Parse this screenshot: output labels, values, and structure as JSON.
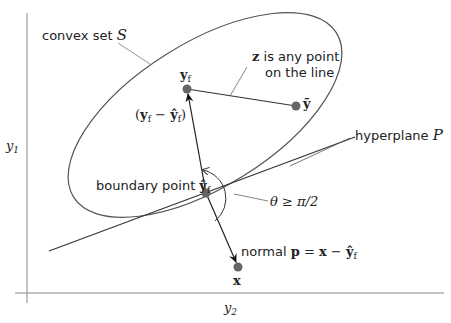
{
  "diagram": {
    "axes": {
      "vertical_label": "y",
      "vertical_label_sub": "1",
      "horizontal_label": "y",
      "horizontal_label_sub": "2"
    },
    "labels": {
      "convex_set_text": "convex set ",
      "convex_set_symbol": "S",
      "z_symbol": "z",
      "z_text_line1": " is any point",
      "z_text_line2": "on the line",
      "yf_symbol": "y",
      "yf_sub": "f",
      "ytilde_symbol": "ỹ",
      "diff_open": "(",
      "diff_y": "y",
      "diff_sub1": "f",
      "diff_minus": " − ",
      "diff_yhat": "ŷ",
      "diff_sub2": "f",
      "diff_close": ")",
      "hyperplane_text": "hyperplane ",
      "hyperplane_symbol": "P",
      "boundary_text": "boundary point ",
      "boundary_symbol": "ŷ",
      "boundary_sub": "f",
      "theta_text": "θ ≥ π/2",
      "normal_text": "normal ",
      "normal_p": "p",
      "normal_eq": " = ",
      "normal_x": "x",
      "normal_minus": " − ",
      "normal_yhat": "ŷ",
      "normal_sub": "f",
      "x_symbol": "x"
    },
    "points": {
      "boundary_point": {
        "x": 206,
        "y": 193
      },
      "y_f": {
        "x": 187,
        "y": 89
      },
      "y_tilde": {
        "x": 296,
        "y": 106
      },
      "x": {
        "x": 238,
        "y": 267
      }
    },
    "colors": {
      "line": "#333333",
      "ellipse": "#555555",
      "point": "#666666",
      "axis": "#888888"
    }
  }
}
